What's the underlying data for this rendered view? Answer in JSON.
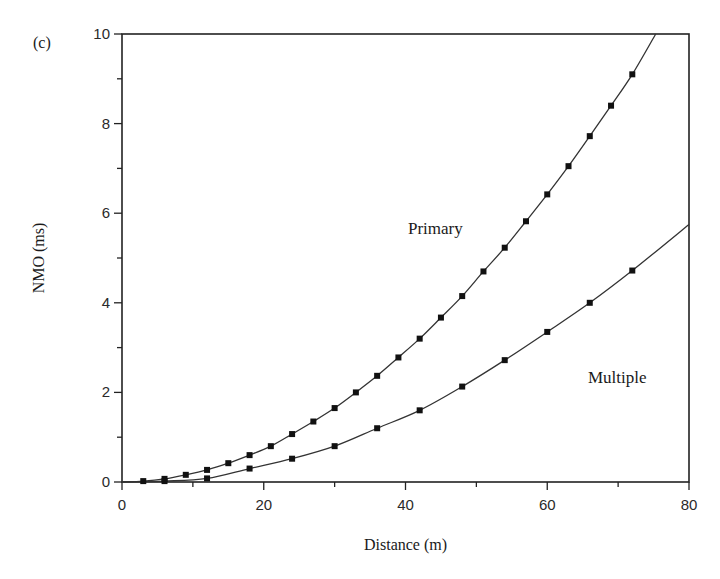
{
  "figure": {
    "panel_label": "(c)",
    "xlabel": "Distance (m)",
    "ylabel": "NMO (ms)",
    "series_labels": {
      "primary": "Primary",
      "multiple": "Multiple"
    }
  },
  "chart_data": {
    "type": "line",
    "title": "",
    "panel": "(c)",
    "xlabel": "Distance (m)",
    "ylabel": "NMO (ms)",
    "xlim": [
      0,
      80
    ],
    "ylim": [
      0,
      10
    ],
    "xticks": [
      0,
      20,
      40,
      60,
      80
    ],
    "yticks": [
      0,
      2,
      4,
      6,
      8,
      10
    ],
    "grid": false,
    "legend": "inline labels",
    "series": [
      {
        "name": "Primary",
        "marker": "square",
        "curve_end": [
          75.3,
          10
        ],
        "x": [
          3,
          6,
          9,
          12,
          15,
          18,
          21,
          24,
          27,
          30,
          33,
          36,
          39,
          42,
          45,
          48,
          51,
          54,
          57,
          60,
          63,
          66,
          69,
          72
        ],
        "values": [
          0.02,
          0.07,
          0.16,
          0.27,
          0.42,
          0.6,
          0.8,
          1.07,
          1.35,
          1.65,
          2.0,
          2.37,
          2.78,
          3.2,
          3.67,
          4.15,
          4.7,
          5.23,
          5.82,
          6.42,
          7.05,
          7.72,
          8.4,
          9.1
        ]
      },
      {
        "name": "Multiple",
        "marker": "square",
        "curve_end": [
          80,
          5.75
        ],
        "x": [
          6,
          12,
          18,
          24,
          30,
          36,
          42,
          48,
          54,
          60,
          66,
          72
        ],
        "values": [
          0.02,
          0.08,
          0.3,
          0.52,
          0.8,
          1.2,
          1.6,
          2.13,
          2.72,
          3.35,
          4.0,
          4.72
        ]
      }
    ]
  }
}
